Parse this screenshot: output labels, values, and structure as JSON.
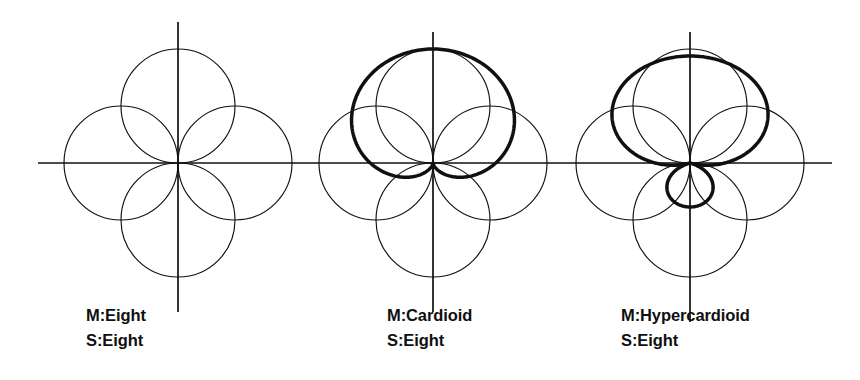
{
  "figure": {
    "background_color": "#ffffff",
    "ink_color": "#101010",
    "thin_stroke_width": 1.1,
    "bold_stroke_width": 3.4,
    "axis_stroke_width": 1.6
  },
  "panels": [
    {
      "id": "panel-eight-eight",
      "index": 1,
      "center_x": 178,
      "center_y": 163,
      "lobe_radius": 57,
      "axis": {
        "h_x1": 38,
        "h_x2": 318,
        "v_y1": 22,
        "v_y2": 312
      },
      "mid_pattern": "Eight",
      "side_pattern": "Eight",
      "bold_curve": "none",
      "thin_lobes": [
        "up",
        "down",
        "left",
        "right"
      ],
      "caption": {
        "mid_label": "M:Eight",
        "side_label": "S:Eight",
        "lines": [
          "M:Eight",
          "S:Eight"
        ],
        "layout": "single-line-split-by-axis",
        "x": 86,
        "y": 303
      }
    },
    {
      "id": "panel-cardioid-eight",
      "index": 2,
      "center_x": 433,
      "center_y": 163,
      "lobe_radius": 57,
      "axis": {
        "h_x1": 318,
        "h_x2": 600,
        "v_y1": 32,
        "v_y2": 312
      },
      "mid_pattern": "Cardioid",
      "side_pattern": "Eight",
      "bold_curve": "cardioid-up",
      "bold_curve_scale": 1.0,
      "thin_lobes": [
        "up",
        "down",
        "left",
        "right"
      ],
      "caption": {
        "mid_label": "M:Cardioid",
        "side_label": "S:Eight",
        "lines": [
          "M:Cardioid",
          "S:Eight"
        ],
        "layout": "two-lines",
        "x": 387,
        "y": 303
      }
    },
    {
      "id": "panel-hypercardioid-eight",
      "index": 3,
      "center_x": 690,
      "center_y": 163,
      "lobe_radius": 57,
      "axis": {
        "h_x1": 600,
        "h_x2": 832,
        "v_y1": 32,
        "v_y2": 322
      },
      "mid_pattern": "Hypercardioid",
      "side_pattern": "Eight",
      "bold_curve": "hypercardioid-up",
      "bold_front_lobe_length": 107,
      "bold_rear_lobe_length": 44,
      "thin_lobes": [
        "up",
        "down",
        "left",
        "right"
      ],
      "caption": {
        "mid_label": "M:Hypercardioid",
        "side_label": "S:Eight",
        "lines": [
          "M:Hypercardioid",
          "S:Eight"
        ],
        "layout": "two-lines",
        "x": 621,
        "y": 303
      }
    }
  ],
  "chart_data": {
    "type": "line",
    "xlabel": "",
    "ylabel": "",
    "legend_position": "below-each-panel",
    "grid": false,
    "panels": [
      {
        "name": "M:Eight / S:Eight",
        "series": [
          {
            "name": "Side: figure-of-eight (left/right lobes)",
            "polar_formula": "r = R * |sin(theta)|",
            "style": "thin",
            "max_radius": 57,
            "lobes": 2,
            "lobe_directions": [
              "left",
              "right"
            ]
          },
          {
            "name": "Mid: figure-of-eight (front/rear lobes)",
            "polar_formula": "r = R * |cos(theta)|",
            "style": "thin",
            "max_radius": 57,
            "lobes": 2,
            "lobe_directions": [
              "up",
              "down"
            ]
          }
        ]
      },
      {
        "name": "M:Cardioid / S:Eight",
        "series": [
          {
            "name": "Side: figure-of-eight (left/right lobes)",
            "polar_formula": "r = R * |sin(theta)|",
            "style": "thin",
            "max_radius": 57,
            "lobes": 2,
            "lobe_directions": [
              "left",
              "right"
            ]
          },
          {
            "name": "Mid: figure-of-eight reference (front/rear lobes)",
            "polar_formula": "r = R * |cos(theta)|",
            "style": "thin",
            "max_radius": 57,
            "lobes": 2,
            "lobe_directions": [
              "up",
              "down"
            ]
          },
          {
            "name": "Mid: cardioid",
            "polar_formula": "r = R * (0.5 + 0.5*cos(theta))",
            "style": "bold",
            "max_radius": 114,
            "lobes": 1,
            "lobe_directions": [
              "up"
            ],
            "null_angle_deg": 180
          }
        ]
      },
      {
        "name": "M:Hypercardioid / S:Eight",
        "series": [
          {
            "name": "Side: figure-of-eight (left/right lobes)",
            "polar_formula": "r = R * |sin(theta)|",
            "style": "thin",
            "max_radius": 57,
            "lobes": 2,
            "lobe_directions": [
              "left",
              "right"
            ]
          },
          {
            "name": "Mid: figure-of-eight reference (front/rear lobes)",
            "polar_formula": "r = R * |cos(theta)|",
            "style": "thin",
            "max_radius": 57,
            "lobes": 2,
            "lobe_directions": [
              "up",
              "down"
            ]
          },
          {
            "name": "Mid: hypercardioid",
            "polar_formula": "r = R * |0.25 + 0.75*cos(theta)|",
            "style": "bold",
            "front_lobe_radius": 107,
            "rear_lobe_radius": 44,
            "lobes": 2,
            "lobe_directions": [
              "up",
              "down"
            ],
            "null_angle_deg": 109.5
          }
        ]
      }
    ]
  }
}
